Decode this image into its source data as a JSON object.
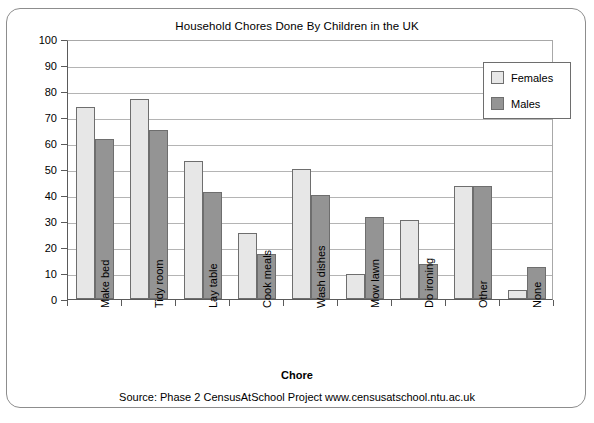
{
  "chart_data": {
    "type": "bar",
    "title": "Household Chores Done By Children in the UK",
    "xlabel": "Chore",
    "ylabel": "Percentage",
    "ylim": [
      0,
      100
    ],
    "ytick_step": 10,
    "yticks": [
      100,
      90,
      80,
      70,
      60,
      50,
      40,
      30,
      20,
      10,
      0
    ],
    "grid": true,
    "legend_position": "top-right",
    "categories": [
      "Make bed",
      "Tidy room",
      "Lay table",
      "Cook meals",
      "Wash dishes",
      "Mow lawn",
      "Do ironing",
      "Other",
      "None"
    ],
    "series": [
      {
        "name": "Females",
        "color": "#e7e7e7",
        "values": [
          74,
          77,
          53,
          25.5,
          50,
          9.5,
          30.5,
          43.5,
          3.5
        ]
      },
      {
        "name": "Males",
        "color": "#949494",
        "values": [
          61.5,
          65,
          41,
          17.5,
          40,
          31.5,
          13.5,
          43.5,
          12.5
        ]
      }
    ],
    "annotations": [
      "Source: Phase 2 CensusAtSchool Project www.censusatschool.ntu.ac.uk"
    ]
  },
  "figure": {
    "source_note": "Source: Phase 2 CensusAtSchool Project www.censusatschool.ntu.ac.uk"
  }
}
